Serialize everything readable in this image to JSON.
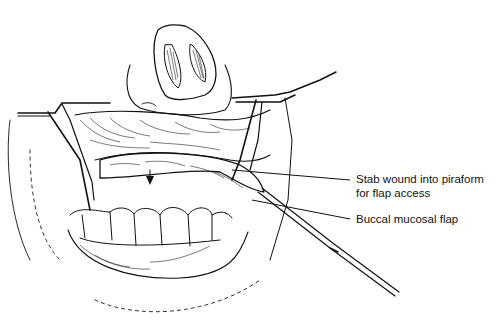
{
  "figure": {
    "type": "surgical illustration",
    "colors": {
      "ink": "#111111",
      "background": "#ffffff"
    }
  },
  "labels": [
    {
      "id": "stab-wound",
      "lines": [
        "Stab wound into piraform",
        "for flap access"
      ]
    },
    {
      "id": "buccal-flap",
      "lines": [
        "Buccal mucosal flap"
      ]
    }
  ],
  "structures": [
    "nose",
    "upper lip",
    "retractor-left",
    "retractor-right",
    "upper teeth",
    "lower lip",
    "chin",
    "buccal mucosal flap",
    "arrow",
    "surgical instrument"
  ]
}
